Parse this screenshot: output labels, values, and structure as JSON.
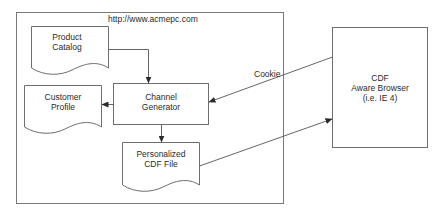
{
  "diagram": {
    "container": {
      "label": "http://www.acmepc.com"
    },
    "nodes": {
      "product_catalog": {
        "line1": "Product",
        "line2": "Catalog",
        "shape": "document"
      },
      "customer_profile": {
        "line1": "Customer",
        "line2": "Profile",
        "shape": "document"
      },
      "channel_generator": {
        "line1": "Channel",
        "line2": "Generator",
        "shape": "process"
      },
      "cdf_file": {
        "line1": "Personalized",
        "line2": "CDF File",
        "shape": "document"
      },
      "browser": {
        "line1": "CDF",
        "line2": "Aware Browser",
        "line3": "(i.e. IE 4)",
        "shape": "process"
      }
    },
    "edges": [
      {
        "from": "product_catalog",
        "to": "channel_generator",
        "label": ""
      },
      {
        "from": "channel_generator",
        "to": "customer_profile",
        "label": ""
      },
      {
        "from": "channel_generator",
        "to": "cdf_file",
        "label": ""
      },
      {
        "from": "browser",
        "to": "channel_generator",
        "label": "Cookie"
      },
      {
        "from": "cdf_file",
        "to": "browser",
        "label": ""
      }
    ]
  }
}
